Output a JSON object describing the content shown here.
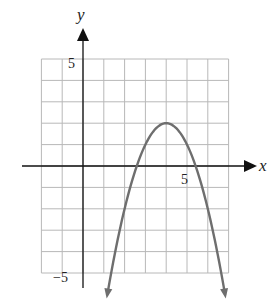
{
  "chart_data": {
    "type": "line",
    "title": "",
    "xlabel": "x",
    "ylabel": "y",
    "xlim": [
      -2,
      7
    ],
    "ylim": [
      -5,
      5
    ],
    "grid": true,
    "tick_labels": {
      "x": [
        {
          "value": 5,
          "label": "5"
        }
      ],
      "y": [
        {
          "value": 5,
          "label": "5"
        },
        {
          "value": -5,
          "label": "−5"
        }
      ]
    },
    "series": [
      {
        "name": "parabola",
        "equation": "y = -(x - 4)^2 + 2",
        "vertex": [
          4,
          2
        ],
        "x_intercepts": [
          2.59,
          5.41
        ],
        "opens": "down",
        "arrows_at_ends": true,
        "x": [
          1.17,
          1.5,
          2,
          2.5,
          3,
          3.5,
          4,
          4.5,
          5,
          5.5,
          6,
          6.5,
          6.83
        ],
        "values": [
          -6,
          -4.25,
          -2,
          -0.25,
          1,
          1.75,
          2,
          1.75,
          1,
          -0.25,
          -2,
          -4.25,
          -6
        ]
      }
    ]
  },
  "labels": {
    "x_axis": "x",
    "y_axis": "y",
    "x_tick_5": "5",
    "y_tick_5": "5",
    "y_tick_neg5": "−5"
  },
  "colors": {
    "grid": "#b8b8b8",
    "axis": "#111111",
    "curve": "#6e6e6e"
  }
}
